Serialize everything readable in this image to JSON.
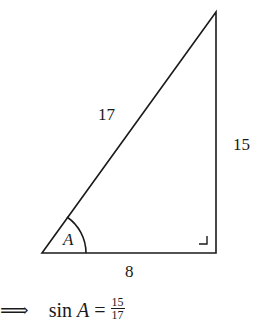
{
  "diagram": {
    "type": "right-triangle",
    "vertices": {
      "A": [
        42,
        253
      ],
      "right_angle": [
        216,
        253
      ],
      "top": [
        216,
        12
      ]
    },
    "labels": {
      "hypotenuse": "17",
      "opposite": "15",
      "adjacent": "8",
      "angle": "A"
    }
  },
  "equation": {
    "arrow": "⟹",
    "lhs": "sin ",
    "var": "A",
    "eq": " = ",
    "numerator": "15",
    "denominator": "17"
  }
}
